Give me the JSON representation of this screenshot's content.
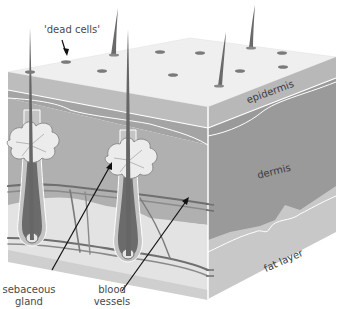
{
  "diagram": {
    "type": "cross-section",
    "colors": {
      "surface_top": "#efefef",
      "epidermis_front": "#bdbdbd",
      "epidermis_side": "#b3b3b3",
      "dermis": "#9a9a9a",
      "dermis_light": "#adadad",
      "fat_layer": "#c9c9c9",
      "fat_light": "#e2e2e2",
      "hair": "#6b6b6b",
      "gland": "#e8e8e8",
      "vessel": "#777777",
      "boundary_line": "#ffffff"
    }
  },
  "labels": {
    "dead_cells": "'dead cells'",
    "epidermis": "epidermis",
    "dermis": "dermis",
    "fat_layer": "fat layer",
    "sebaceous_gland_line1": "sebaceous",
    "sebaceous_gland_line2": "gland",
    "blood_vessels_line1": "blood",
    "blood_vessels_line2": "vessels"
  }
}
